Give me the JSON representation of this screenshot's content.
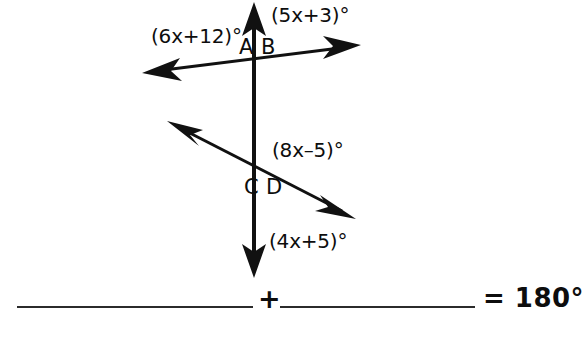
{
  "figure": {
    "stroke_color": "#111111",
    "background_color": "#ffffff",
    "points": [
      {
        "id": "A",
        "label": "A",
        "x": 239,
        "y": 48
      },
      {
        "id": "B",
        "label": "B",
        "x": 261,
        "y": 48
      },
      {
        "id": "C",
        "label": "C",
        "x": 244,
        "y": 189
      },
      {
        "id": "D",
        "label": "D",
        "x": 266,
        "y": 189
      }
    ],
    "angle_labels": [
      {
        "id": "upper-left",
        "text": "(6x+12)°",
        "x": 151,
        "y": 26
      },
      {
        "id": "upper-right",
        "text": "(5x+3)°",
        "x": 271,
        "y": 5
      },
      {
        "id": "middle-right",
        "text": "(8x–5)°",
        "x": 272,
        "y": 140
      },
      {
        "id": "lower-right",
        "text": "(4x+5)°",
        "x": 269,
        "y": 231
      }
    ],
    "lines": [
      {
        "id": "vertical-ray",
        "description": "vertical double-headed ray through both intersections",
        "x1": 254,
        "y1": 6,
        "x2": 254,
        "y2": 272,
        "arrow_start": true,
        "arrow_end": true,
        "width": 4
      },
      {
        "id": "upper-transversal",
        "description": "transversal through points A and B",
        "x1": 150,
        "y1": 72,
        "x2": 352,
        "y2": 47,
        "arrow_start": true,
        "arrow_end": true,
        "width": 3
      },
      {
        "id": "lower-transversal",
        "description": "transversal through points C and D",
        "x1": 174,
        "y1": 125,
        "x2": 348,
        "y2": 214,
        "arrow_start": true,
        "arrow_end": true,
        "width": 3
      }
    ]
  },
  "equation": {
    "blank_first": "",
    "blank_second": "",
    "plus_symbol": "+",
    "result_text": "= 180°"
  }
}
